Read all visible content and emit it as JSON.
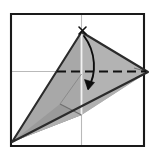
{
  "figure": {
    "caption": "",
    "canvas": {
      "width": 155,
      "height": 156,
      "background": "#ffffff"
    }
  },
  "colors": {
    "paper_outline": "#1a1a1a",
    "crease_guide": "#b9b9b9",
    "shape_outline": "#2b2b2b",
    "fill_light": "#b3b3b3",
    "fill_mid": "#a8a8a8",
    "fill_dark": "#9a9a9a",
    "fold_line": "#111111",
    "arrow": "#0d0d0d",
    "mark": "#111111",
    "paper_white": "#ffffff"
  },
  "paper": {
    "name": "square-sheet",
    "points": "11,14 144,14 144,146 11,146",
    "stroke_width": 2.1
  },
  "guides": [
    {
      "name": "horizontal-center-guide",
      "x1": 11,
      "y1": 71.5,
      "x2": 144,
      "y2": 71.5,
      "stroke_width": 1.1
    },
    {
      "name": "vertical-center-guide",
      "x1": 81.5,
      "y1": 14,
      "x2": 81.5,
      "y2": 146,
      "stroke_width": 1.1
    }
  ],
  "facets": [
    {
      "name": "facet-left-wing",
      "points": "12,142 81.5,32 81.5,115",
      "fill": "#a8a8a8"
    },
    {
      "name": "facet-lower-left",
      "points": "12,142 81.5,115 60,104",
      "fill": "#9a9a9a"
    },
    {
      "name": "facet-right-wing",
      "points": "81.5,32 148,72 81.5,115",
      "fill": "#b3b3b3"
    },
    {
      "name": "facet-lower-right",
      "points": "12,142 81.5,115 148,72",
      "fill": "#b0b0b0"
    }
  ],
  "creases": [
    {
      "name": "crease-apex-to-bottom",
      "d": "M 81.5 32 L 81.5 115",
      "stroke": "#f2f2f2",
      "stroke_width": 1.8
    },
    {
      "name": "crease-left-diagonal",
      "d": "M 60 104 L 81.5 115",
      "stroke": "#6e6e6e",
      "stroke_width": 1.1
    },
    {
      "name": "crease-left-upper",
      "d": "M 60 104 L 81.5 74",
      "stroke": "#8a8a8a",
      "stroke_width": 1.0
    },
    {
      "name": "crease-right-tip",
      "d": "M 134 68 L 148 72 L 135 78",
      "stroke": "#6e6e6e",
      "stroke_width": 1.0
    }
  ],
  "outline": {
    "name": "kite-outline",
    "points": "12,142 81.5,32 148,72",
    "stroke_width": 2.1
  },
  "fold_line": {
    "name": "valley-fold-dashed-line",
    "x1": 57,
    "y1": 71.5,
    "x2": 146,
    "y2": 71.5,
    "dash": "9 5",
    "stroke_width": 2.2
  },
  "arrow": {
    "name": "fold-direction-arrow",
    "path": "M 84 36 C 96 52, 97 74, 88 88",
    "stroke_width": 1.9,
    "head": "M 88 90 L 84.5 79.5 L 94.5 82.5 Z"
  },
  "mark": {
    "name": "x-reference-mark",
    "stroke_width": 1.6,
    "strokes": [
      {
        "x1": 79,
        "y1": 27,
        "x2": 86,
        "y2": 34
      },
      {
        "x1": 86,
        "y1": 27,
        "x2": 79,
        "y2": 34
      }
    ]
  },
  "labels": {
    "apex_mark": "",
    "fold_label": "",
    "step_number": ""
  }
}
